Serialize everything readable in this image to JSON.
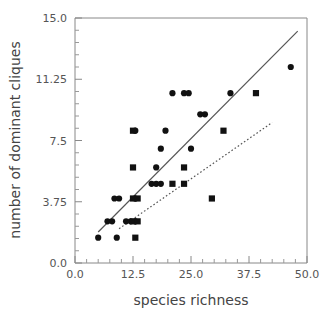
{
  "chart_data": {
    "type": "scatter",
    "title": "",
    "xlabel": "species richness",
    "ylabel": "number of dominant cliques",
    "xlim": [
      0.0,
      50.0
    ],
    "ylim": [
      0.0,
      15.0
    ],
    "xticks": [
      "0.0",
      "12.5",
      "25.0",
      "37.5",
      "50.0"
    ],
    "xtick_values": [
      0.0,
      12.5,
      25.0,
      37.5,
      50.0
    ],
    "yticks": [
      "0.0",
      "3.75",
      "7.5",
      "11.25",
      "15.0"
    ],
    "ytick_values": [
      0.0,
      3.75,
      7.5,
      11.25,
      15.0
    ],
    "grid": false,
    "legend": "none",
    "minor_ticks": true,
    "minor_tick_count_x": 4,
    "minor_tick_count_y": 4,
    "marker_color": "#111111",
    "line_color": "#555555",
    "series": [
      {
        "name": "circles",
        "marker": "circle",
        "points": [
          [
            5.0,
            1.55
          ],
          [
            9.0,
            1.55
          ],
          [
            7.0,
            2.55
          ],
          [
            8.0,
            2.55
          ],
          [
            11.0,
            2.55
          ],
          [
            12.0,
            2.55
          ],
          [
            13.0,
            2.55
          ],
          [
            8.5,
            3.95
          ],
          [
            9.5,
            3.95
          ],
          [
            13.0,
            3.95
          ],
          [
            16.5,
            4.85
          ],
          [
            17.5,
            4.85
          ],
          [
            18.5,
            4.85
          ],
          [
            17.5,
            5.85
          ],
          [
            18.5,
            7.0
          ],
          [
            19.5,
            8.1
          ],
          [
            13.0,
            8.1
          ],
          [
            25.0,
            7.0
          ],
          [
            21.0,
            10.4
          ],
          [
            23.5,
            10.4
          ],
          [
            24.5,
            10.4
          ],
          [
            27.0,
            9.1
          ],
          [
            28.0,
            9.1
          ],
          [
            33.5,
            10.4
          ],
          [
            46.5,
            12.0
          ]
        ]
      },
      {
        "name": "squares",
        "marker": "square",
        "points": [
          [
            13.0,
            1.55
          ],
          [
            12.5,
            2.55
          ],
          [
            13.5,
            2.55
          ],
          [
            12.5,
            3.95
          ],
          [
            13.5,
            3.95
          ],
          [
            12.5,
            5.85
          ],
          [
            12.5,
            8.1
          ],
          [
            21.0,
            4.85
          ],
          [
            23.5,
            4.85
          ],
          [
            23.5,
            5.85
          ],
          [
            29.5,
            3.95
          ],
          [
            32.0,
            8.1
          ],
          [
            39.0,
            10.4
          ]
        ]
      }
    ],
    "trend_lines": [
      {
        "name": "solid-regression-line",
        "style": "solid",
        "x1": 5.0,
        "y1": 1.9,
        "x2": 48.0,
        "y2": 14.2
      },
      {
        "name": "dashed-regression-line",
        "style": "dashed",
        "x1": 9.5,
        "y1": 2.1,
        "x2": 42.5,
        "y2": 8.6
      }
    ]
  }
}
